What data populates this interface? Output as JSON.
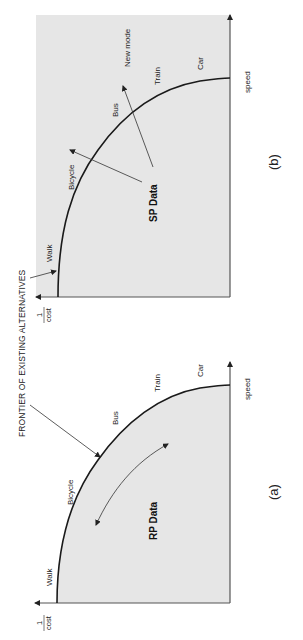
{
  "figure": {
    "orientation": "rotated-90-ccw",
    "frontier_label": "FRONTIER OF EXISTING ALTERNATIVES",
    "colors": {
      "background": "#ffffff",
      "panel_fill": "#e6e6e6",
      "curve": "#1a1a1a",
      "axis": "#555555",
      "arrow": "#333333"
    }
  },
  "panel_a": {
    "caption": "(a)",
    "y_axis_label_num": "1",
    "y_axis_label_den": "cost",
    "x_axis_label": "speed",
    "center_label": "RP Data",
    "modes": [
      "Walk",
      "Bicycle",
      "Bus",
      "Train",
      "Car"
    ]
  },
  "panel_b": {
    "caption": "(b)",
    "y_axis_label_num": "1",
    "y_axis_label_den": "cost",
    "x_axis_label": "speed",
    "center_label": "SP Data",
    "modes": [
      "Walk",
      "Bicycle",
      "Bus",
      "Train",
      "Car",
      "New mode"
    ]
  }
}
